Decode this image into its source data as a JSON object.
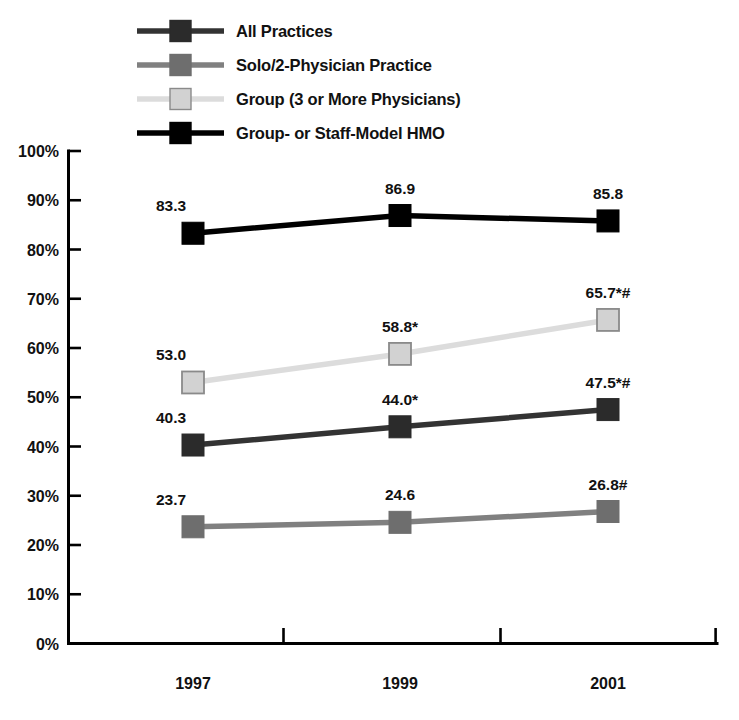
{
  "chart_data": {
    "type": "line",
    "title": "",
    "subtitle": "",
    "xlabel": "",
    "ylabel": "",
    "categories": [
      "1997",
      "1999",
      "2001"
    ],
    "x": [
      1997,
      1999,
      2001
    ],
    "ylim": [
      0,
      100
    ],
    "y_tick_labels": [
      "0%",
      "10%",
      "20%",
      "30%",
      "40%",
      "50%",
      "60%",
      "70%",
      "80%",
      "90%",
      "100%"
    ],
    "y_tick_values": [
      0,
      10,
      20,
      30,
      40,
      50,
      60,
      70,
      80,
      90,
      100
    ],
    "grid": false,
    "legend_position": "top-left",
    "series": [
      {
        "name": "All Practices",
        "color": "#333333",
        "marker_fill": "#2b2b2b",
        "values": [
          40.3,
          44.0,
          47.5
        ],
        "labels": [
          "40.3",
          "44.0*",
          "47.5*#"
        ]
      },
      {
        "name": "Solo/2-Physician Practice",
        "color": "#808080",
        "marker_fill": "#6e6e6e",
        "values": [
          23.7,
          24.6,
          26.8
        ],
        "labels": [
          "23.7",
          "24.6",
          "26.8#"
        ]
      },
      {
        "name": "Group (3 or More Physicians)",
        "color": "#dcdcdc",
        "marker_fill": "#d2d2d2",
        "values": [
          53.0,
          58.8,
          65.7
        ],
        "labels": [
          "53.0",
          "58.8*",
          "65.7*#"
        ]
      },
      {
        "name": "Group- or Staff-Model HMO",
        "color": "#000000",
        "marker_fill": "#000000",
        "values": [
          83.3,
          86.9,
          85.8
        ],
        "labels": [
          "83.3",
          "86.9",
          "85.8"
        ]
      }
    ]
  },
  "legend": {
    "items": [
      {
        "label": "All Practices",
        "color": "#333333",
        "marker_fill": "#2b2b2b"
      },
      {
        "label": "Solo/2-Physician Practice",
        "color": "#808080",
        "marker_fill": "#6e6e6e"
      },
      {
        "label": "Group (3 or More Physicians)",
        "color": "#dcdcdc",
        "marker_fill": "#d2d2d2"
      },
      {
        "label": "Group- or Staff-Model HMO",
        "color": "#000000",
        "marker_fill": "#000000"
      }
    ]
  },
  "axes": {
    "y_ticks": [
      "100%",
      "90%",
      "80%",
      "70%",
      "60%",
      "50%",
      "40%",
      "30%",
      "20%",
      "10%",
      "0%"
    ],
    "x_ticks": [
      "1997",
      "1999",
      "2001"
    ]
  }
}
